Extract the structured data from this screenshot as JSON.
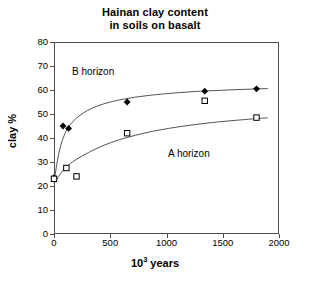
{
  "chart_data": {
    "type": "scatter",
    "title": "Hainan clay content in soils on basalt",
    "title_line1": "Hainan clay content",
    "title_line2": "in soils on basalt",
    "xlabel_prefix": "10",
    "xlabel_exp": "3",
    "xlabel_suffix": " years",
    "xlabel": "103 years",
    "ylabel": "clay %",
    "xlim": [
      0,
      2000
    ],
    "ylim": [
      0,
      80
    ],
    "xticks": [
      0,
      500,
      1000,
      1500,
      2000
    ],
    "yticks": [
      0,
      10,
      20,
      30,
      40,
      50,
      60,
      70,
      80
    ],
    "grid": false,
    "legend": "none",
    "annotations": [
      {
        "text": "B horizon",
        "x": 160,
        "y": 68
      },
      {
        "text": "A horizon",
        "x": 1020,
        "y": 35
      }
    ],
    "series": [
      {
        "name": "B horizon",
        "marker": "filled-diamond",
        "color": "#000000",
        "points": [
          {
            "x": 0,
            "y": 23.5
          },
          {
            "x": 80,
            "y": 45.0
          },
          {
            "x": 130,
            "y": 44.0
          },
          {
            "x": 650,
            "y": 55.0
          },
          {
            "x": 1340,
            "y": 59.5
          },
          {
            "x": 1800,
            "y": 60.5
          }
        ],
        "fit_curve": [
          {
            "x": 0,
            "y": 21.5
          },
          {
            "x": 40,
            "y": 33.0
          },
          {
            "x": 90,
            "y": 41.0
          },
          {
            "x": 160,
            "y": 46.5
          },
          {
            "x": 300,
            "y": 51.5
          },
          {
            "x": 500,
            "y": 55.0
          },
          {
            "x": 800,
            "y": 57.5
          },
          {
            "x": 1200,
            "y": 59.2
          },
          {
            "x": 1600,
            "y": 60.1
          },
          {
            "x": 1900,
            "y": 60.6
          }
        ]
      },
      {
        "name": "A horizon",
        "marker": "open-square",
        "color": "#000000",
        "points": [
          {
            "x": 0,
            "y": 23.0
          },
          {
            "x": 110,
            "y": 27.5
          },
          {
            "x": 200,
            "y": 24.0
          },
          {
            "x": 650,
            "y": 42.0
          },
          {
            "x": 1340,
            "y": 55.5
          },
          {
            "x": 1800,
            "y": 48.5
          }
        ],
        "fit_curve": [
          {
            "x": 0,
            "y": 21.0
          },
          {
            "x": 100,
            "y": 27.5
          },
          {
            "x": 250,
            "y": 32.5
          },
          {
            "x": 500,
            "y": 38.0
          },
          {
            "x": 800,
            "y": 42.0
          },
          {
            "x": 1100,
            "y": 44.6
          },
          {
            "x": 1400,
            "y": 46.4
          },
          {
            "x": 1700,
            "y": 47.7
          },
          {
            "x": 1900,
            "y": 48.4
          }
        ]
      }
    ]
  },
  "colors": {
    "axis": "#4d4d4d",
    "curve": "#555555",
    "marker": "#000000",
    "background": "#ffffff"
  }
}
